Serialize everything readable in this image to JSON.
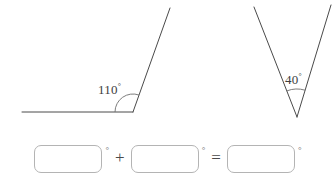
{
  "figure_left": {
    "name": "obtuse-angle-diagram",
    "angle_label": "110",
    "degree_symbol": "°",
    "measure_degrees": 110,
    "vertex": {
      "x": 133,
      "y": 112
    },
    "ray_horizontal_end": {
      "x": 22,
      "y": 112
    },
    "ray_slanted_end": {
      "x": 170,
      "y": 8
    },
    "arc_radius": 18,
    "stroke_color": "#4a4a4a"
  },
  "figure_right": {
    "name": "acute-angle-diagram",
    "angle_label": "40",
    "degree_symbol": "°",
    "measure_degrees": 40,
    "vertex": {
      "x": 297,
      "y": 117
    },
    "ray_left_end": {
      "x": 254,
      "y": 7
    },
    "ray_right_end": {
      "x": 331,
      "y": 5
    },
    "arc_radius": 28,
    "stroke_color": "#4a4a4a"
  },
  "equation": {
    "name": "angle-sum-equation",
    "box1": {
      "value": "",
      "placeholder": "",
      "degree_symbol": "°"
    },
    "operator_plus": "+",
    "box2": {
      "value": "",
      "placeholder": "",
      "degree_symbol": "°"
    },
    "operator_equals": "=",
    "box3": {
      "value": "",
      "placeholder": "",
      "degree_symbol": "°"
    }
  },
  "colors": {
    "background": "#ffffff",
    "line": "#4a4a4a",
    "text": "#3a3a3a",
    "box_border": "#b4b4b4"
  }
}
